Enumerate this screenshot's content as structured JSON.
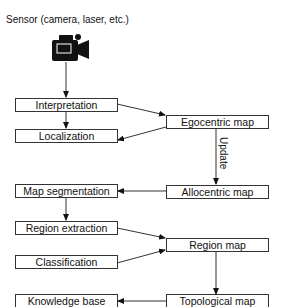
{
  "title": "Sensor (camera, laser, etc.)",
  "sensor_icon": "video-camera-icon",
  "left_nodes": {
    "interpretation": "Interpretation",
    "localization": "Localization",
    "map_segmentation": "Map segmentation",
    "region_extraction": "Region extraction",
    "classification": "Classification",
    "knowledge_base": "Knowledge base"
  },
  "right_nodes": {
    "egocentric_map": "Egocentric map",
    "allocentric_map": "Allocentric map",
    "region_map": "Region map",
    "topological_map": "Topological map"
  },
  "edge_labels": {
    "update": "Update"
  },
  "colors": {
    "line": "#333333",
    "text": "#111111",
    "background": "#ffffff"
  }
}
